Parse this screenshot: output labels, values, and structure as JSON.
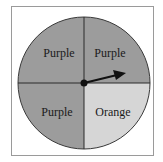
{
  "spinner": {
    "sections": [
      {
        "label": "Purple",
        "position": "top-left",
        "color": "#9c9c9c"
      },
      {
        "label": "Purple",
        "position": "top-right",
        "color": "#9c9c9c"
      },
      {
        "label": "Purple",
        "position": "bottom-left",
        "color": "#9c9c9c"
      },
      {
        "label": "Orange",
        "position": "bottom-right",
        "color": "#d6d6d6"
      }
    ],
    "pointer": {
      "points_to": "top-right",
      "color": "#111111"
    }
  }
}
